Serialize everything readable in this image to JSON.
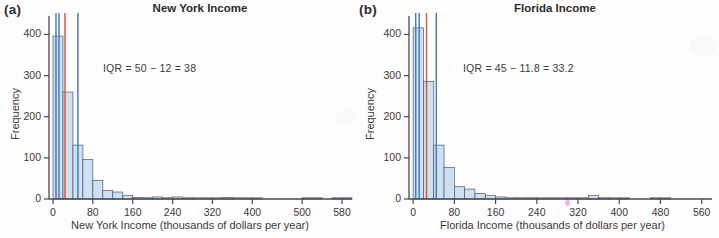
{
  "figure": {
    "background_color": "#fdfdfd",
    "bar_fill_color": "#cfe0f2",
    "bar_edge_color": "#4a5a6a",
    "quartile_line_color": "#4a7ebb",
    "median_line_color": "#e0553f",
    "axis_color": "#4a4a4a",
    "text_color": "#3a3a3a"
  },
  "panels": [
    {
      "label": "(a)",
      "title": "New York Income",
      "annotation": "IQR = 50 − 12 = 38",
      "xlabel": "New York Income (thousands of dollars per year)",
      "ylabel": "Frequency",
      "xticks": [
        "0",
        "80",
        "160",
        "240",
        "320",
        "400",
        "500",
        "580"
      ],
      "yticks": [
        "0",
        "100",
        "200",
        "300",
        "400"
      ]
    },
    {
      "label": "(b)",
      "title": "Florida Income",
      "annotation": "IQR = 45 − 11.8 = 33.2",
      "xlabel": "Florida Income (thousands of dollars per year)",
      "ylabel": "Frequency",
      "xticks": [
        "0",
        "80",
        "160",
        "240",
        "320",
        "400",
        "480",
        "560"
      ],
      "yticks": [
        "0",
        "100",
        "200",
        "300",
        "400"
      ]
    }
  ],
  "chart_data": [
    {
      "type": "bar",
      "title": "New York Income",
      "panel": "(a)",
      "xlabel": "New York Income (thousands of dollars per year)",
      "ylabel": "Frequency",
      "xlim": [
        -8,
        600
      ],
      "ylim": [
        0,
        440
      ],
      "xticks": [
        0,
        80,
        160,
        240,
        320,
        400,
        500,
        580
      ],
      "yticks": [
        0,
        100,
        200,
        300,
        400
      ],
      "grid": false,
      "bin_width": 20,
      "bin_starts": [
        0,
        20,
        40,
        60,
        80,
        100,
        120,
        140,
        160,
        180,
        200,
        220,
        240,
        260,
        280,
        300,
        320,
        340,
        360,
        380,
        400,
        420,
        440,
        460,
        480,
        500,
        520,
        540,
        560,
        580
      ],
      "values": [
        396,
        260,
        131,
        96,
        45,
        21,
        17,
        9,
        4,
        3,
        5,
        3,
        5,
        2,
        1,
        1,
        2,
        4,
        3,
        1,
        1,
        0,
        0,
        0,
        0,
        2,
        1,
        0,
        1,
        1
      ],
      "annotations": [
        {
          "text": "IQR = 50 − 12 = 38",
          "x": 120,
          "y": 300
        }
      ],
      "vlines": [
        {
          "x": 6,
          "color": "#4a7ebb",
          "label": "lower whisker"
        },
        {
          "x": 12,
          "color": "#4a7ebb",
          "label": "Q1 = 12"
        },
        {
          "x": 24,
          "color": "#e0553f",
          "label": "median"
        },
        {
          "x": 50,
          "color": "#4a7ebb",
          "label": "Q3 = 50"
        }
      ]
    },
    {
      "type": "bar",
      "title": "Florida Income",
      "panel": "(b)",
      "xlabel": "Florida Income (thousands of dollars per year)",
      "ylabel": "Frequency",
      "xlim": [
        -8,
        580
      ],
      "ylim": [
        0,
        440
      ],
      "xticks": [
        0,
        80,
        160,
        240,
        320,
        400,
        480,
        560
      ],
      "yticks": [
        0,
        100,
        200,
        300,
        400
      ],
      "grid": false,
      "bin_width": 20,
      "bin_starts": [
        0,
        20,
        40,
        60,
        80,
        100,
        120,
        140,
        160,
        180,
        200,
        220,
        240,
        260,
        280,
        300,
        320,
        340,
        360,
        380,
        400,
        420,
        440,
        460,
        480,
        500,
        520,
        540,
        560
      ],
      "values": [
        416,
        286,
        131,
        77,
        30,
        24,
        13,
        9,
        5,
        3,
        2,
        2,
        2,
        1,
        1,
        1,
        2,
        9,
        3,
        2,
        1,
        0,
        0,
        3,
        1,
        0,
        0,
        0,
        0
      ],
      "annotations": [
        {
          "text": "IQR = 45 − 11.8 = 33.2",
          "x": 120,
          "y": 300
        }
      ],
      "vlines": [
        {
          "x": 5,
          "color": "#4a7ebb",
          "label": "lower whisker"
        },
        {
          "x": 11.8,
          "color": "#4a7ebb",
          "label": "Q1 = 11.8"
        },
        {
          "x": 26,
          "color": "#e0553f",
          "label": "median"
        },
        {
          "x": 45,
          "color": "#4a7ebb",
          "label": "Q3 = 45"
        }
      ]
    }
  ]
}
